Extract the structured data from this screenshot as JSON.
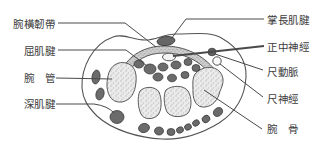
{
  "figure": {
    "type": "anatomical-cross-section-wrist-carpal-tunnel",
    "labels": {
      "left": [
        {
          "id": "transverse-carpal-ligament",
          "text": "腕橫韌帶"
        },
        {
          "id": "flexor-tendon",
          "text": "屈肌腱"
        },
        {
          "id": "carpal-tunnel",
          "text": "腕　管"
        },
        {
          "id": "deep-tendon",
          "text": "深肌腱"
        }
      ],
      "right": [
        {
          "id": "palmaris-longus-tendon",
          "text": "掌長肌腱"
        },
        {
          "id": "median-nerve",
          "text": "正中神經"
        },
        {
          "id": "ulnar-artery",
          "text": "尺動脈"
        },
        {
          "id": "ulnar-nerve",
          "text": "尺神經"
        },
        {
          "id": "carpal-bone",
          "text": "腕　骨"
        }
      ]
    },
    "colors": {
      "background": "#ffffff",
      "outline": "#555555",
      "leader_line": "#4a4a4a",
      "tendon_fill": "#6b6b6b",
      "tendon_stroke": "#3e3e3e",
      "ligament_fill": "#cccccc",
      "bone_fill": "#ebebeb",
      "bone_speckle": "#b6b6b6",
      "nerve_fill": "#f4f4f4",
      "text": "#3c3c3c"
    }
  }
}
